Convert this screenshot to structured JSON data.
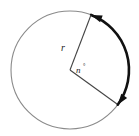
{
  "figure": {
    "type": "circle-arc-central-angle-diagram",
    "canvas": {
      "width": 139,
      "height": 136,
      "background": "#ffffff"
    },
    "circle": {
      "name": "circle-outline",
      "center_x": 70,
      "center_y": 70,
      "radius": 59,
      "stroke": "#8a8a8a",
      "stroke_width": 1.1,
      "fill": "none"
    },
    "arc": {
      "name": "highlighted-arc",
      "stroke": "#111111",
      "stroke_width": 2.6,
      "start_angle_deg": -69,
      "end_angle_deg": 36,
      "start_point": {
        "x": 91,
        "y": 15
      },
      "end_point": {
        "x": 118,
        "y": 105
      },
      "arrowhead_start": true,
      "arrowhead_end": true
    },
    "radii": [
      {
        "name": "radius-upper",
        "from_x": 70,
        "from_y": 70,
        "to_x": 91,
        "to_y": 15,
        "stroke": "#444444",
        "stroke_width": 1.1
      },
      {
        "name": "radius-lower",
        "from_x": 70,
        "from_y": 70,
        "to_x": 117,
        "to_y": 104,
        "stroke": "#444444",
        "stroke_width": 1.1
      }
    ],
    "labels": {
      "radius_label": {
        "text": "r",
        "x": 61,
        "y": 51,
        "font_size": 10,
        "italic": true
      },
      "angle_label": {
        "text": "n",
        "degree_symbol": "°",
        "x": 76,
        "y": 73,
        "font_size": 9,
        "degree_x": 83,
        "degree_y": 68,
        "degree_font_size": 6,
        "italic": true
      }
    }
  }
}
